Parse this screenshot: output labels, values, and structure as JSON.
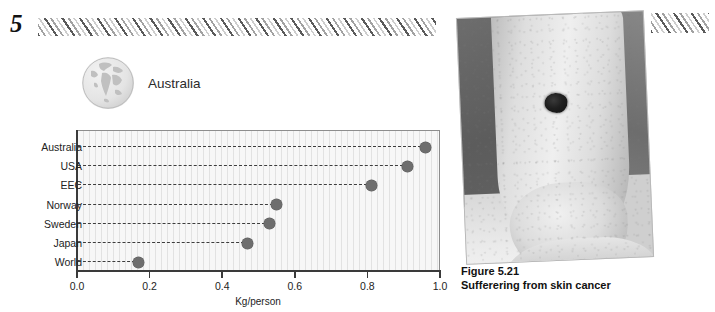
{
  "header": {
    "chapter_number": "5",
    "hatch_pattern": "diagonal-hatch-band"
  },
  "region": {
    "icon": "globe-icon",
    "title": "Australia"
  },
  "chart_data": {
    "type": "scatter",
    "title": "Australia",
    "xlabel": "Kg/person",
    "ylabel": "",
    "xlim": [
      0.0,
      1.0
    ],
    "grid": true,
    "legend": "none",
    "orientation": "horizontal",
    "categories": [
      "Australia",
      "USA",
      "EEC",
      "Norway",
      "Sweden",
      "Japan",
      "World"
    ],
    "values": [
      0.96,
      0.91,
      0.81,
      0.55,
      0.53,
      0.47,
      0.17
    ],
    "xticks": [
      "0.0",
      "0.2",
      "0.4",
      "0.6",
      "0.8",
      "1.0"
    ],
    "xtick_values": [
      0.0,
      0.2,
      0.4,
      0.6,
      0.8,
      1.0
    ],
    "marker_color": "#6e6e6e",
    "leader_line_style": "dashed",
    "plot_background": "#f7f7f7"
  },
  "figure": {
    "caption_number": "Figure 5.21",
    "caption_text": "Sufferering from skin cancer",
    "photo_alt": "photograph of a lower leg and ankle with a dark skin-cancer lesion"
  }
}
